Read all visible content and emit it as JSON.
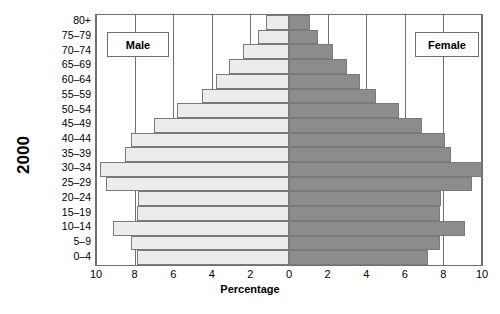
{
  "year_label": "2000",
  "legend": {
    "male": "Male",
    "female": "Female"
  },
  "axis": {
    "x_title": "Percentage",
    "x_ticks": [
      "10",
      "8",
      "6",
      "4",
      "2",
      "0",
      "2",
      "4",
      "6",
      "8",
      "10"
    ]
  },
  "colors": {
    "male_fill": "#ececec",
    "female_fill": "#8c8c8c",
    "bar_border": "#7a7a7a",
    "axis": "#6f6f6f",
    "text": "#000000"
  },
  "chart_data": {
    "type": "bar",
    "subtype": "population-pyramid",
    "title": "",
    "xlabel": "Percentage",
    "ylabel": "2000",
    "xlim": [
      -10,
      10
    ],
    "xtick_values": [
      -10,
      -8,
      -6,
      -4,
      -2,
      0,
      2,
      4,
      6,
      8,
      10
    ],
    "xtick_labels": [
      "10",
      "8",
      "6",
      "4",
      "2",
      "0",
      "2",
      "4",
      "6",
      "8",
      "10"
    ],
    "grid": true,
    "legend_position": "inside-top-left-and-top-right",
    "categories": [
      "0-4",
      "5-9",
      "10-14",
      "15-19",
      "20-24",
      "25-29",
      "30-34",
      "35-39",
      "40-44",
      "45-49",
      "50-54",
      "55-59",
      "60-64",
      "65-69",
      "70-74",
      "75-79",
      "80+"
    ],
    "series": [
      {
        "name": "Male",
        "values": [
          7.9,
          8.2,
          9.1,
          7.9,
          7.8,
          9.5,
          9.8,
          8.5,
          8.2,
          7.0,
          5.8,
          4.5,
          3.8,
          3.1,
          2.4,
          1.6,
          1.2
        ]
      },
      {
        "name": "Female",
        "values": [
          7.2,
          7.8,
          9.1,
          7.8,
          7.9,
          9.5,
          10.0,
          8.4,
          8.1,
          6.9,
          5.7,
          4.5,
          3.7,
          3.0,
          2.3,
          1.5,
          1.1
        ]
      }
    ]
  }
}
